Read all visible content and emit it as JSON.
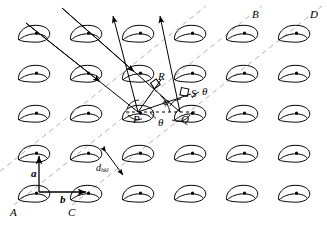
{
  "figure": {
    "type": "crystallography-diagram",
    "width": 327,
    "height": 229,
    "background": "#ffffff",
    "ink": "#000000",
    "plane_line_color": "#b3b3b3"
  },
  "lattice": {
    "description": "Two-dimensional lattice of comma-shaped motifs with a central dot at each lattice point",
    "columns": 6,
    "rows": 5,
    "origin_x": 35,
    "origin_y": 33,
    "spacing_x": 52,
    "spacing_y": 40,
    "motif_name": "comma-motif",
    "motif_dot_name": "lattice-point-dot"
  },
  "points": [
    {
      "id": "P",
      "label": "P",
      "x": 138,
      "y": 112,
      "label_x": 133,
      "label_y": 114
    },
    {
      "id": "Q",
      "label": "Q",
      "x": 180,
      "y": 112,
      "label_x": 180,
      "label_y": 114
    },
    {
      "id": "R",
      "label": "R",
      "x": 160,
      "y": 80,
      "label_x": 158,
      "label_y": 73
    },
    {
      "id": "S",
      "label": "S",
      "x": 190,
      "y": 95,
      "label_x": 191,
      "label_y": 90
    }
  ],
  "planes": [
    {
      "id": "A",
      "label": "A",
      "label_x": 10,
      "label_y": 210
    },
    {
      "id": "B",
      "label": "B",
      "label_x": 252,
      "label_y": 12
    },
    {
      "id": "C",
      "label": "C",
      "label_x": 68,
      "label_y": 210
    },
    {
      "id": "D",
      "label": "D",
      "label_x": 312,
      "label_y": 12
    }
  ],
  "angles": [
    {
      "id": "phi",
      "label": "φ",
      "label_x": 163,
      "label_y": 101,
      "description": "angle phi at P between incident beam and lattice row"
    },
    {
      "id": "theta_P",
      "label": "θ",
      "label_x": 160,
      "label_y": 119,
      "description": "Bragg angle theta below the PQ row"
    },
    {
      "id": "theta_S",
      "label": "θ",
      "label_x": 203,
      "label_y": 89,
      "description": "angle theta at S between diffracted ray and plane normal"
    }
  ],
  "vectors": [
    {
      "id": "a",
      "label": "a",
      "label_x": 33,
      "label_y": 172,
      "description": "lattice translation vector a, vertical, upward"
    },
    {
      "id": "b",
      "label": "b",
      "label_x": 62,
      "label_y": 198,
      "description": "lattice translation vector b, horizontal, rightward"
    }
  ],
  "spacing": {
    "id": "d_hkl",
    "label_main": "d",
    "label_sub": "hkl",
    "label_x": 96,
    "label_y": 168,
    "description": "interplanar spacing d subscript hkl between adjacent lattice planes"
  },
  "rays": {
    "incident": [
      {
        "id": "incident-ray-1",
        "from_x": 26,
        "from_y": 23,
        "to_x": 138,
        "to_y": 112,
        "arrow_at": 0.62
      },
      {
        "id": "incident-ray-2",
        "from_x": 62,
        "from_y": 8,
        "to_x": 180,
        "to_y": 112,
        "arrow_at": 0.6
      }
    ],
    "diffracted": [
      {
        "id": "diffracted-ray-1",
        "from_x": 138,
        "from_y": 112,
        "to_x": 113,
        "to_y": 14
      },
      {
        "id": "diffracted-ray-2",
        "from_x": 180,
        "from_y": 112,
        "to_x": 160,
        "to_y": 14
      }
    ],
    "path_segments": [
      {
        "id": "segment-PR",
        "from_x": 138,
        "from_y": 112,
        "to_x": 160,
        "to_y": 80
      },
      {
        "id": "segment-PS",
        "from_x": 138,
        "from_y": 112,
        "to_x": 190,
        "to_y": 95
      }
    ],
    "baseline": {
      "id": "row-PQ-baseline",
      "from_x": 126,
      "from_y": 112,
      "to_x": 196,
      "to_y": 112
    }
  },
  "right_angles": [
    {
      "id": "right-angle-R",
      "x": 152,
      "y": 86,
      "description": "perpendicular mark at R on incident ray"
    },
    {
      "id": "right-angle-S",
      "x": 183,
      "y": 90,
      "description": "perpendicular mark at S on diffracted ray"
    }
  ]
}
